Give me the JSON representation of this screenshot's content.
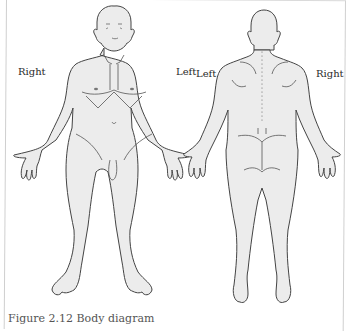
{
  "diagram": {
    "front_view": {
      "label_left_side": "Right",
      "label_right_side": "Left"
    },
    "back_view": {
      "label_left_side": "Left",
      "label_right_side": "Right"
    },
    "caption": "Figure 2.12 Body diagram",
    "colors": {
      "body_fill": "#ececec",
      "outline": "#444444",
      "text": "#2a2a2a"
    }
  }
}
